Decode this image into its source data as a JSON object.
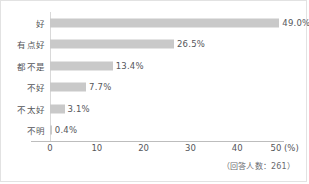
{
  "chart_data": {
    "type": "bar",
    "orientation": "horizontal",
    "title": "",
    "subtitle": "",
    "xlabel": "(%)",
    "ylabel": "",
    "categories": [
      "好",
      "有点好",
      "都不是",
      "不好",
      "不太好",
      "不明"
    ],
    "values": [
      49.0,
      26.5,
      13.4,
      7.7,
      3.1,
      0.4
    ],
    "value_labels": [
      "49.0%",
      "26.5%",
      "13.4%",
      "7.7%",
      "3.1%",
      "0.4%"
    ],
    "xlim": [
      0,
      50
    ],
    "xticks": [
      0,
      10,
      20,
      30,
      40,
      50
    ],
    "xtick_labels": [
      "0",
      "10",
      "20",
      "30",
      "40",
      "50"
    ],
    "grid": false,
    "legend": null,
    "annotation": "（回答人数：261）",
    "bar_color": "#c9c9c9",
    "text_color": "#55565a",
    "axis_color": "#bdbdbd",
    "background": "#ffffff"
  }
}
